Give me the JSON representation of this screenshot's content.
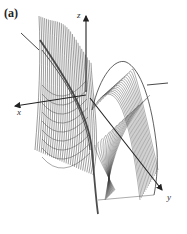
{
  "figure": {
    "panel_label": "(a)",
    "axes": {
      "x_label": "x",
      "y_label": "y",
      "z_label": "z"
    },
    "colors": {
      "mesh": "#3a3a3a",
      "axis": "#222222",
      "background": "#ffffff"
    }
  }
}
